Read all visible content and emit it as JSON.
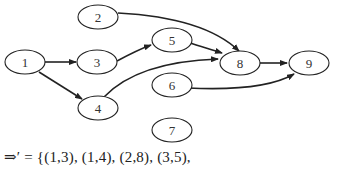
{
  "diagram": {
    "type": "directed-graph",
    "nodes": [
      {
        "id": "1",
        "label": "1",
        "cx": 25,
        "cy": 62
      },
      {
        "id": "2",
        "label": "2",
        "cx": 98,
        "cy": 17
      },
      {
        "id": "3",
        "label": "3",
        "cx": 97,
        "cy": 62
      },
      {
        "id": "4",
        "label": "4",
        "cx": 98,
        "cy": 108
      },
      {
        "id": "5",
        "label": "5",
        "cx": 172,
        "cy": 40
      },
      {
        "id": "6",
        "label": "6",
        "cx": 172,
        "cy": 85
      },
      {
        "id": "7",
        "label": "7",
        "cx": 172,
        "cy": 130
      },
      {
        "id": "8",
        "label": "8",
        "cx": 240,
        "cy": 63
      },
      {
        "id": "9",
        "label": "9",
        "cx": 309,
        "cy": 63
      }
    ],
    "edges": [
      {
        "from": "1",
        "to": "3"
      },
      {
        "from": "1",
        "to": "4"
      },
      {
        "from": "2",
        "to": "8"
      },
      {
        "from": "3",
        "to": "5"
      },
      {
        "from": "4",
        "to": "8"
      },
      {
        "from": "5",
        "to": "8"
      },
      {
        "from": "6",
        "to": "9"
      },
      {
        "from": "8",
        "to": "9"
      }
    ]
  },
  "formula": {
    "text": "⇒′ = {(1,3), (1,4), (2,8), (3,5),"
  }
}
